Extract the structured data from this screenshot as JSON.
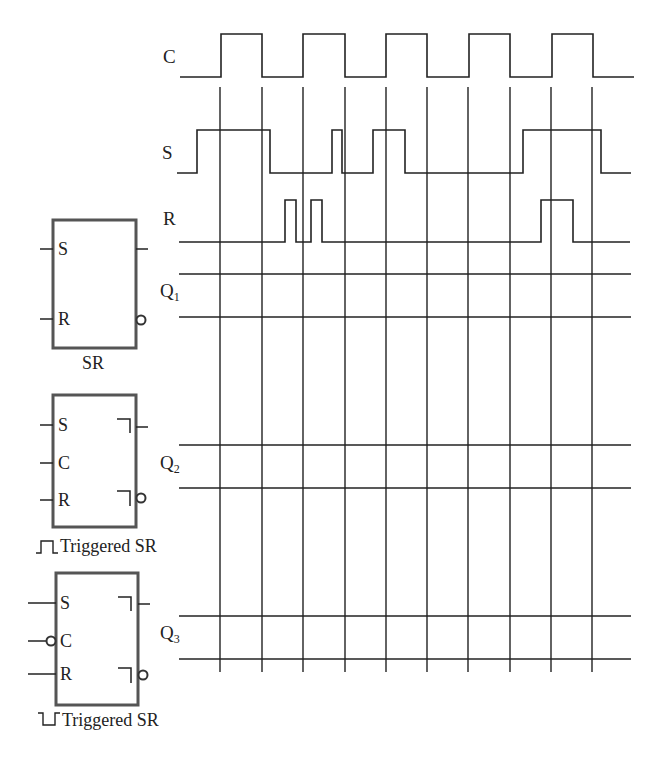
{
  "signals": {
    "C": {
      "label": "C",
      "low_y": 77,
      "high_y": 34
    },
    "S": {
      "label": "S",
      "low_y": 173,
      "high_y": 130
    },
    "R": {
      "label": "R",
      "low_y": 242,
      "high_y": 200
    },
    "Q1": {
      "label": "Q",
      "sub": "1",
      "top_y": 274,
      "bottom_y": 317
    },
    "Q2": {
      "label": "Q",
      "sub": "2",
      "top_y": 445,
      "bottom_y": 488
    },
    "Q3": {
      "label": "Q",
      "sub": "3",
      "top_y": 616,
      "bottom_y": 659
    }
  },
  "waveforms": {
    "C": [
      [
        180,
        77
      ],
      [
        221,
        77
      ],
      [
        221,
        34
      ],
      [
        262,
        34
      ],
      [
        262,
        77
      ],
      [
        303,
        77
      ],
      [
        303,
        34
      ],
      [
        345,
        34
      ],
      [
        345,
        77
      ],
      [
        386,
        77
      ],
      [
        386,
        34
      ],
      [
        427,
        34
      ],
      [
        427,
        77
      ],
      [
        469,
        77
      ],
      [
        469,
        34
      ],
      [
        510,
        34
      ],
      [
        510,
        77
      ],
      [
        552,
        77
      ],
      [
        552,
        34
      ],
      [
        593,
        34
      ],
      [
        593,
        77
      ],
      [
        634,
        77
      ]
    ],
    "S": [
      [
        177,
        173
      ],
      [
        197,
        173
      ],
      [
        197,
        130
      ],
      [
        270,
        130
      ],
      [
        270,
        173
      ],
      [
        332,
        173
      ],
      [
        332,
        130
      ],
      [
        342,
        130
      ],
      [
        342,
        173
      ],
      [
        373,
        173
      ],
      [
        373,
        130
      ],
      [
        405,
        130
      ],
      [
        405,
        173
      ],
      [
        523,
        173
      ],
      [
        523,
        130
      ],
      [
        601,
        130
      ],
      [
        601,
        173
      ],
      [
        631,
        173
      ]
    ],
    "R": [
      [
        179,
        242
      ],
      [
        285,
        242
      ],
      [
        285,
        200
      ],
      [
        296,
        200
      ],
      [
        296,
        242
      ],
      [
        311,
        242
      ],
      [
        311,
        200
      ],
      [
        322,
        200
      ],
      [
        322,
        242
      ],
      [
        541,
        242
      ],
      [
        541,
        200
      ],
      [
        573,
        200
      ],
      [
        573,
        242
      ],
      [
        630,
        242
      ]
    ]
  },
  "grid": {
    "vertical_x": [
      220,
      262,
      303,
      345,
      386,
      427,
      468,
      510,
      551,
      592
    ],
    "top_y": 87,
    "bottom_y": 672,
    "line_x_start": 179,
    "line_x_end": 631
  },
  "blocks": [
    {
      "name": "SR",
      "caption": "SR",
      "caption_prefix": "",
      "box": {
        "x": 53,
        "y": 220,
        "w": 83,
        "h": 128
      },
      "pins": [
        {
          "label": "S",
          "y": 249
        },
        {
          "label": "R",
          "y": 319
        }
      ],
      "clock_inverted": false,
      "postponed": false
    },
    {
      "name": "pulse-triggered-sr",
      "caption": "Triggered SR",
      "caption_prefix": "positive-pulse",
      "box": {
        "x": 53,
        "y": 395,
        "w": 83,
        "h": 132
      },
      "pins": [
        {
          "label": "S",
          "y": 425
        },
        {
          "label": "C",
          "y": 463
        },
        {
          "label": "R",
          "y": 500
        }
      ],
      "clock_inverted": false,
      "postponed": true
    },
    {
      "name": "negative-pulse-triggered-sr",
      "caption": "Triggered SR",
      "caption_prefix": "negative-pulse",
      "box": {
        "x": 56,
        "y": 573,
        "w": 82,
        "h": 132
      },
      "pins": [
        {
          "label": "S",
          "y": 603
        },
        {
          "label": "C",
          "y": 641
        },
        {
          "label": "R",
          "y": 674
        }
      ],
      "clock_inverted": true,
      "postponed": true
    }
  ],
  "colors": {
    "line": "#222222",
    "box_border": "#555555"
  }
}
